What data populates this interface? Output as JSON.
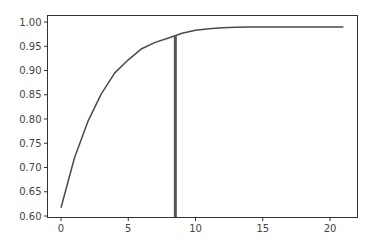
{
  "chart_data": {
    "type": "line",
    "title": "",
    "xlabel": "",
    "ylabel": "",
    "xlim": [
      -1.05,
      22.05
    ],
    "ylim": [
      0.6,
      1.01
    ],
    "grid": false,
    "legend": null,
    "x_ticks": [
      0,
      5,
      10,
      15,
      20
    ],
    "x_tick_labels": [
      "0",
      "5",
      "10",
      "15",
      "20"
    ],
    "y_ticks": [
      0.6,
      0.65,
      0.7,
      0.75,
      0.8,
      0.85,
      0.9,
      0.95,
      1.0
    ],
    "y_tick_labels": [
      "0.60",
      "0.65",
      "0.70",
      "0.75",
      "0.80",
      "0.85",
      "0.90",
      "0.95",
      "1.00"
    ],
    "series": [
      {
        "name": "cumulative",
        "color": "#4a4a4a",
        "x": [
          0,
          1,
          2,
          3,
          4,
          5,
          6,
          7,
          8,
          9,
          10,
          11,
          12,
          13,
          14,
          15,
          16,
          17,
          18,
          19,
          20,
          21
        ],
        "values": [
          0.617,
          0.72,
          0.795,
          0.852,
          0.895,
          0.922,
          0.945,
          0.958,
          0.967,
          0.977,
          0.983,
          0.986,
          0.988,
          0.989,
          0.99,
          0.99,
          0.99,
          0.99,
          0.99,
          0.99,
          0.99,
          0.99
        ]
      }
    ],
    "annotations": [
      {
        "type": "vertical_line",
        "x": 8.5,
        "y_from": 0.6,
        "y_to": 0.971,
        "color": "#555555",
        "width": 3
      }
    ]
  }
}
